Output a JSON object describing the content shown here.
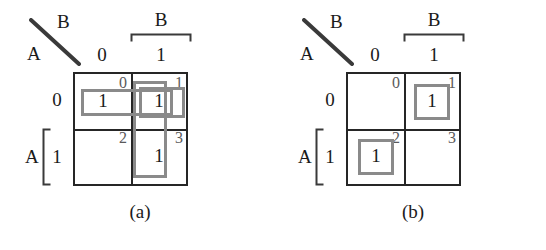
{
  "figure": {
    "title_colors": {
      "grid_line": "#262626",
      "group_box": "#8a8a8a",
      "minterm_index": "#5a5a5a",
      "text": "#1a1a1a",
      "background": "#ffffff"
    }
  },
  "panels": [
    {
      "id": "a",
      "caption": "(a)",
      "corner": {
        "top_variable": "B",
        "side_variable": "A",
        "diagonal": "diagonal-divider"
      },
      "column_variable": "B",
      "column_labels": [
        "0",
        "1"
      ],
      "row_variable": "A",
      "row_labels": [
        "0",
        "1"
      ],
      "cells": [
        {
          "minterm": "0",
          "value": "1"
        },
        {
          "minterm": "1",
          "value": "1"
        },
        {
          "minterm": "2",
          "value": ""
        },
        {
          "minterm": "3",
          "value": "1"
        }
      ],
      "groups": [
        {
          "name": "group-horizontal-row0",
          "cells": [
            "0",
            "1"
          ]
        },
        {
          "name": "group-vertical-col1",
          "cells": [
            "1",
            "3"
          ]
        },
        {
          "name": "group-single-minterm1",
          "cells": [
            "1"
          ]
        }
      ]
    },
    {
      "id": "b",
      "caption": "(b)",
      "corner": {
        "top_variable": "B",
        "side_variable": "A",
        "diagonal": "diagonal-divider"
      },
      "column_variable": "B",
      "column_labels": [
        "0",
        "1"
      ],
      "row_variable": "A",
      "row_labels": [
        "0",
        "1"
      ],
      "cells": [
        {
          "minterm": "0",
          "value": ""
        },
        {
          "minterm": "1",
          "value": "1"
        },
        {
          "minterm": "2",
          "value": "1"
        },
        {
          "minterm": "3",
          "value": ""
        }
      ],
      "groups": [
        {
          "name": "group-single-minterm1",
          "cells": [
            "1"
          ]
        },
        {
          "name": "group-single-minterm2",
          "cells": [
            "2"
          ]
        }
      ]
    }
  ]
}
